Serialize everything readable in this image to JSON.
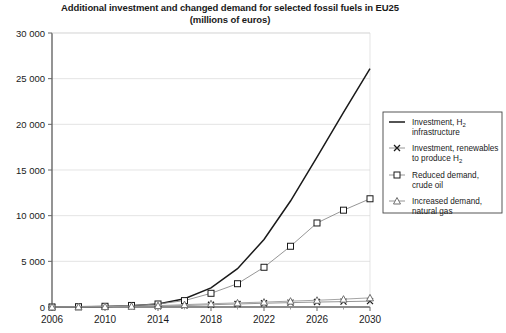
{
  "chart_data": {
    "type": "line",
    "title": "Additional investment and changed demand for selected fossil fuels in EU25",
    "subtitle": "(millions of euros)",
    "xlabel": "",
    "ylabel": "",
    "xlim": [
      2006,
      2030
    ],
    "ylim": [
      0,
      30000
    ],
    "ytick_step": 5000,
    "xtick_step": 4,
    "xminor_step": 2,
    "grid": true,
    "legend_position": "right",
    "ytick_labels": [
      "0",
      "5 000",
      "10 000",
      "15 000",
      "20 000",
      "25 000",
      "30 000"
    ],
    "ytick_values": [
      0,
      5000,
      10000,
      15000,
      20000,
      25000,
      30000
    ],
    "xtick_labels": [
      "2006",
      "2010",
      "2014",
      "2018",
      "2022",
      "2026",
      "2030"
    ],
    "xtick_values": [
      2006,
      2010,
      2014,
      2018,
      2022,
      2026,
      2030
    ],
    "x": [
      2006,
      2008,
      2010,
      2012,
      2014,
      2016,
      2018,
      2020,
      2022,
      2024,
      2026,
      2028,
      2030
    ],
    "series": [
      {
        "name": "Investment, H2 infrastructure",
        "label_main": "Investment, H",
        "label_sub": "2",
        "label_rest": "infrastructure",
        "marker": "none",
        "color": "#1a1a1a",
        "values": [
          0,
          20,
          60,
          140,
          330,
          900,
          2100,
          4200,
          7400,
          11600,
          16400,
          21300,
          26100
        ]
      },
      {
        "name": "Investment, renewables to produce H2",
        "label_main": "Investment, renewables",
        "label_sub": "2",
        "label_rest": "to produce H",
        "marker": "cross",
        "color": "#8a8a8a",
        "values": [
          0,
          10,
          25,
          50,
          90,
          160,
          250,
          330,
          410,
          480,
          540,
          590,
          640
        ]
      },
      {
        "name": "Reduced demand, crude oil",
        "label_main": "Reduced demand,",
        "label_rest": "crude oil",
        "marker": "square",
        "color": "#8a8a8a",
        "values": [
          0,
          30,
          80,
          170,
          330,
          700,
          1500,
          2550,
          4350,
          6650,
          9200,
          10600,
          11850
        ]
      },
      {
        "name": "Increased demand, natural gas",
        "label_main": "Increased demand,",
        "label_rest": "natural gas",
        "marker": "triangle",
        "color": "#9a9a9a",
        "values": [
          0,
          15,
          40,
          85,
          150,
          260,
          360,
          450,
          540,
          640,
          740,
          860,
          1000
        ]
      }
    ]
  },
  "legend": {
    "entries": [
      {
        "line1": "Investment, H",
        "sub": "2",
        "line2": "infrastructure",
        "marker": "none"
      },
      {
        "line1": "Investment, renewables",
        "line2": "to produce H",
        "sub2": "2",
        "marker": "cross"
      },
      {
        "line1": "Reduced demand,",
        "line2": "crude oil",
        "marker": "square"
      },
      {
        "line1": "Increased demand,",
        "line2": "natural gas",
        "marker": "triangle"
      }
    ]
  }
}
